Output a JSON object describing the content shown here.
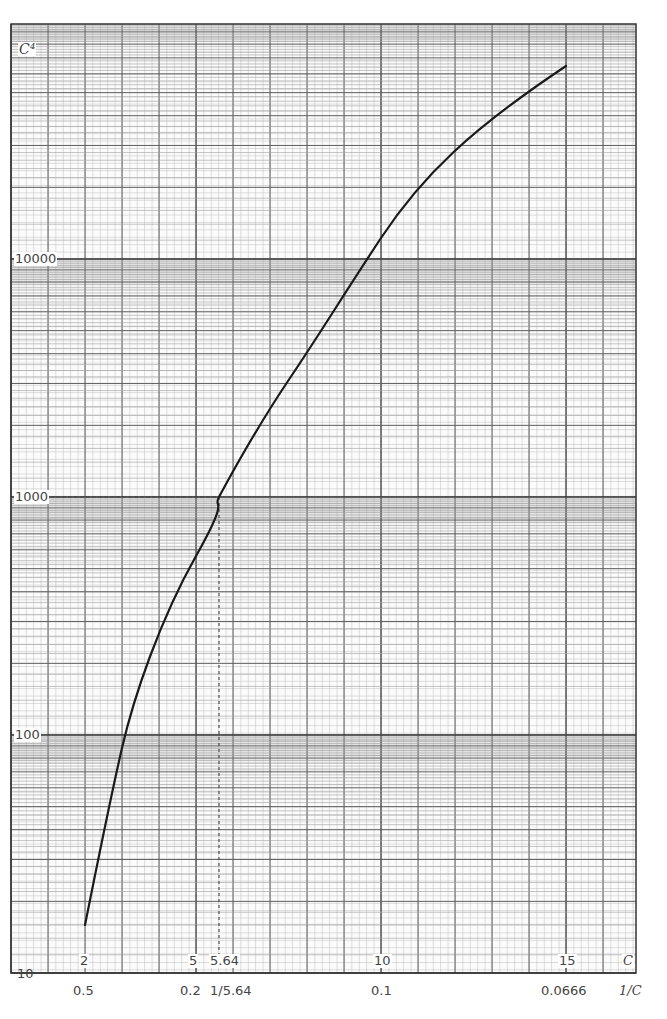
{
  "chart_data": {
    "type": "line",
    "title": "",
    "xlabel": "C",
    "xlabel_secondary": "1/C",
    "ylabel": "C⁴",
    "yscale": "log",
    "xscale": "linear",
    "ylim": [
      10,
      100000
    ],
    "xlim": [
      0,
      16.5
    ],
    "grid": true,
    "legend": "none",
    "y_tick_labels": [
      "10",
      "100",
      "1000",
      "10000"
    ],
    "x_tick_labels": [
      "2",
      "5",
      "5.64",
      "10",
      "15"
    ],
    "x_secondary_tick_labels": [
      "0.5",
      "0.2",
      "1/5.64",
      "0.1",
      "0.0666"
    ],
    "annotations": [
      {
        "type": "dashed-reference",
        "x": 5.64,
        "y": 1000,
        "text": "C = 5.64 where C⁴ = 1000"
      }
    ],
    "series": [
      {
        "name": "C⁴",
        "x": [
          2,
          3,
          4,
          5,
          5.64,
          7,
          8,
          10,
          12,
          15
        ],
        "y": [
          16,
          81,
          256,
          625,
          1000,
          2401,
          4096,
          10000,
          20736,
          50625
        ]
      }
    ]
  },
  "labels": {
    "y_axis": "C⁴",
    "y_10": "10",
    "y_100": "100",
    "y_1000": "1000",
    "y_10000": "10000",
    "x_2": "2",
    "x_5": "5",
    "x_564": "5.64",
    "x_10": "10",
    "x_15": "15",
    "x_axis": "C",
    "inv_05": "0.5",
    "inv_02": "0.2",
    "inv_564": "1/5.64",
    "inv_01": "0.1",
    "inv_00666": "0.0666",
    "inv_axis": "1/C"
  },
  "colors": {
    "minor_grid": "#9a9a9a",
    "major_grid": "#555555",
    "curve": "#1a1a1a",
    "band": "#8c8c8c"
  }
}
